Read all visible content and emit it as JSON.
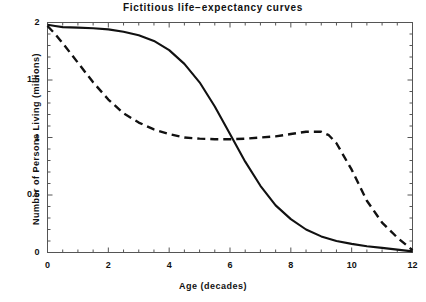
{
  "chart_data": {
    "type": "line",
    "title": "Fictitious  life−expectancy  curves",
    "xlabel": "Age (decades)",
    "ylabel": "Number  of  Persons  Living (millions)",
    "xlim": [
      0,
      12
    ],
    "ylim": [
      0,
      2
    ],
    "xticks": [
      0,
      2,
      4,
      6,
      8,
      10,
      12
    ],
    "xtick_labels": [
      "0",
      "2",
      "4",
      "6",
      "8",
      "10",
      "12"
    ],
    "yticks": [
      0,
      0.5,
      1,
      1.5,
      2
    ],
    "ytick_labels": [
      "0",
      "0.5",
      "1",
      "1.5",
      "2"
    ],
    "x_minor_step": 0.5,
    "y_minor_step": 0.1,
    "grid": false,
    "legend": "none",
    "frame": "box",
    "line_color": "#111111",
    "background": "#ffffff",
    "series": [
      {
        "name": "solid-curve",
        "style": "solid",
        "color": "#111111",
        "x": [
          0,
          0.25,
          0.5,
          1,
          1.5,
          2,
          2.5,
          3,
          3.5,
          4,
          4.5,
          5,
          5.5,
          6,
          6.5,
          7,
          7.5,
          8,
          8.5,
          9,
          9.5,
          10,
          10.5,
          11,
          11.5,
          12
        ],
        "y": [
          1.98,
          1.97,
          1.96,
          1.955,
          1.95,
          1.94,
          1.92,
          1.89,
          1.84,
          1.76,
          1.64,
          1.48,
          1.27,
          1.03,
          0.79,
          0.58,
          0.41,
          0.29,
          0.2,
          0.14,
          0.1,
          0.075,
          0.055,
          0.04,
          0.025,
          0.01
        ]
      },
      {
        "name": "dashed-curve",
        "style": "dashed",
        "color": "#111111",
        "x": [
          0,
          0.25,
          0.5,
          1,
          1.5,
          2,
          2.5,
          3,
          3.5,
          4,
          4.5,
          5,
          5.5,
          6,
          6.5,
          7,
          7.5,
          8,
          8.5,
          9,
          9.25,
          9.5,
          10,
          10.5,
          11,
          11.5,
          12
        ],
        "y": [
          1.97,
          1.9,
          1.82,
          1.65,
          1.48,
          1.33,
          1.21,
          1.13,
          1.07,
          1.03,
          1.0,
          0.99,
          0.985,
          0.985,
          0.99,
          1.0,
          1.01,
          1.03,
          1.05,
          1.05,
          1.02,
          0.95,
          0.72,
          0.45,
          0.26,
          0.13,
          0.02
        ]
      }
    ],
    "annotations": [
      {
        "text": "curves cross",
        "x": 5.95,
        "y": 0.99
      }
    ]
  },
  "axes": {
    "x_tick_label_positions": [
      0,
      2,
      4,
      6,
      8,
      10,
      12
    ],
    "y_tick_label_positions": [
      0,
      0.5,
      1,
      1.5,
      2
    ]
  }
}
